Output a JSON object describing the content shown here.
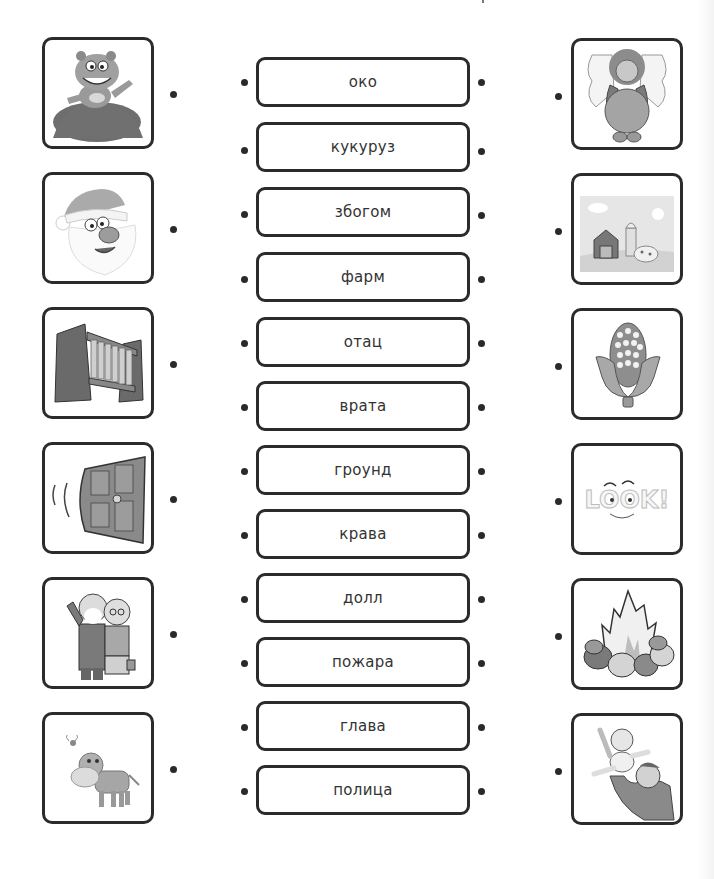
{
  "worksheet": {
    "type": "word-picture matching",
    "words": [
      "око",
      "кукуруз",
      "збогом",
      "фарм",
      "отац",
      "врата",
      "гроунд",
      "крава",
      "долл",
      "пожара",
      "глава",
      "полица"
    ],
    "left_pictures": [
      {
        "icon": "groundhog-icon",
        "description": "groundhog waving from a mound of dirt"
      },
      {
        "icon": "santa-claus-icon",
        "description": "Santa Claus face"
      },
      {
        "icon": "bookshelf-icon",
        "description": "shelf with books"
      },
      {
        "icon": "door-icon",
        "description": "door swinging open"
      },
      {
        "icon": "elderly-couple-icon",
        "description": "grandparents couple"
      },
      {
        "icon": "cow-icon",
        "description": "cartoon cow with a bee"
      }
    ],
    "right_pictures": [
      {
        "icon": "doll-icon",
        "description": "angel doll"
      },
      {
        "icon": "farm-icon",
        "description": "farm with barn, silo and sheep"
      },
      {
        "icon": "corn-icon",
        "description": "ear of corn"
      },
      {
        "icon": "look-eye-icon",
        "description": "LOOK! text with eyes"
      },
      {
        "icon": "campfire-icon",
        "description": "campfire with stones"
      },
      {
        "icon": "father-baby-icon",
        "description": "father lifting a baby"
      }
    ]
  }
}
